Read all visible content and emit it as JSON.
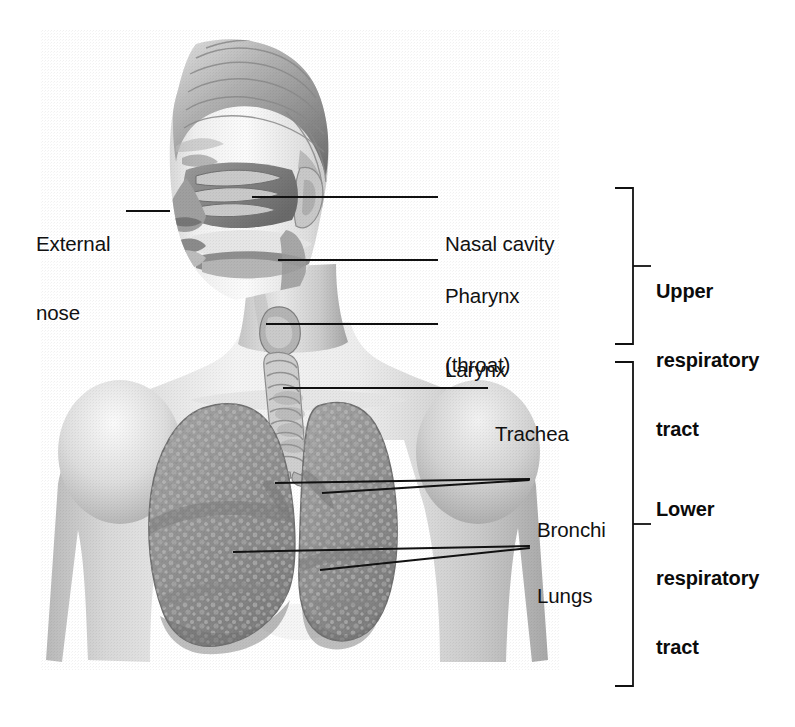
{
  "diagram": {
    "style": "grayscale medical illustration",
    "background_color": "#ffffff",
    "line_color": "#111111"
  },
  "labels": [
    {
      "id": "external-nose",
      "text": "External\nnose",
      "line1": "External",
      "line2": "nose",
      "align": "right",
      "x": 36,
      "y": 186
    },
    {
      "id": "nasal-cavity",
      "text": "Nasal cavity",
      "line1": "Nasal cavity",
      "line2": "",
      "align": "left",
      "x": 445,
      "y": 186
    },
    {
      "id": "pharynx",
      "text": "Pharynx\n(throat)",
      "line1": "Pharynx",
      "line2": "(throat)",
      "align": "left",
      "x": 445,
      "y": 238
    },
    {
      "id": "larynx",
      "text": "Larynx",
      "line1": "Larynx",
      "line2": "",
      "align": "left",
      "x": 445,
      "y": 312
    },
    {
      "id": "trachea",
      "text": "Trachea",
      "line1": "Trachea",
      "line2": "",
      "align": "left",
      "x": 495,
      "y": 376
    },
    {
      "id": "bronchi",
      "text": "Bronchi",
      "line1": "Bronchi",
      "line2": "",
      "align": "left",
      "x": 537,
      "y": 472
    },
    {
      "id": "lungs",
      "text": "Lungs",
      "line1": "Lungs",
      "line2": "",
      "align": "left",
      "x": 537,
      "y": 538
    }
  ],
  "brackets": [
    {
      "id": "upper-respiratory-tract",
      "line1": "Upper",
      "line2": "respiratory",
      "line3": "tract",
      "top": 188,
      "bottom": 344,
      "stem_x": 633,
      "text_x": 656,
      "text_y": 234
    },
    {
      "id": "lower-respiratory-tract",
      "line1": "Lower",
      "line2": "respiratory",
      "line3": "tract",
      "top": 362,
      "bottom": 686,
      "stem_x": 633,
      "text_x": 656,
      "text_y": 452
    }
  ],
  "leaders": [
    {
      "id": "external-nose-leader",
      "x1": 126,
      "y1": 210,
      "x2": 170,
      "y2": 210
    },
    {
      "id": "nasal-cavity-leader",
      "x1": 252,
      "y1": 196,
      "x2": 438,
      "y2": 196
    },
    {
      "id": "pharynx-leader",
      "x1": 278,
      "y1": 259,
      "x2": 438,
      "y2": 259
    },
    {
      "id": "larynx-leader",
      "x1": 266,
      "y1": 323,
      "x2": 438,
      "y2": 323
    },
    {
      "id": "trachea-leader",
      "x1": 283,
      "y1": 387,
      "x2": 488,
      "y2": 387
    },
    {
      "id": "bronchi-leader-left",
      "x1": 275,
      "y1": 482,
      "x2": 530,
      "y2": 478
    },
    {
      "id": "bronchi-leader-right",
      "x1": 322,
      "y1": 492,
      "x2": 530,
      "y2": 479
    },
    {
      "id": "lungs-leader-left",
      "x1": 233,
      "y1": 551,
      "x2": 530,
      "y2": 545
    },
    {
      "id": "lungs-leader-right",
      "x1": 320,
      "y1": 569,
      "x2": 530,
      "y2": 547
    }
  ]
}
